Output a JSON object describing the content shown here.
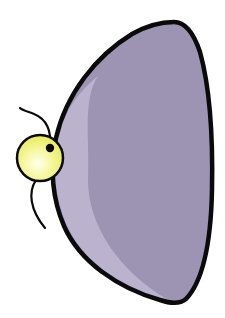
{
  "illustration": {
    "subject": "cartoon purple half-dome shape with yellow glowing bulb",
    "colors": {
      "background": "#ffffff",
      "body_fill": "#9d93b3",
      "body_highlight": "#bbb3cd",
      "outline": "#0a0a0a",
      "bulb_center": "#ffffee",
      "bulb_edge": "#eef06a"
    }
  }
}
